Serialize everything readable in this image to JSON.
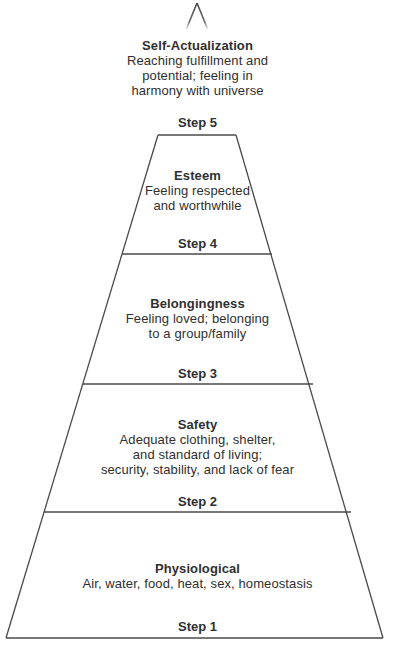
{
  "diagram": {
    "line_color": "#4a4a4a",
    "text_color": "#2f2f2f",
    "background": "#ffffff",
    "apex_marker": "pyramid-apex-lines"
  },
  "levels": [
    {
      "id": "self-actualization",
      "title": "Self-Actualization",
      "description": "Reaching fulfillment and\npotential; feeling in\nharmony with universe",
      "step_label": "Step 5"
    },
    {
      "id": "esteem",
      "title": "Esteem",
      "description": "Feeling respected\nand worthwhile",
      "step_label": "Step 4"
    },
    {
      "id": "belongingness",
      "title": "Belongingness",
      "description": "Feeling loved; belonging\nto a group/family",
      "step_label": "Step 3"
    },
    {
      "id": "safety",
      "title": "Safety",
      "description": "Adequate clothing, shelter,\nand standard of living;\nsecurity, stability, and lack of fear",
      "step_label": "Step 2"
    },
    {
      "id": "physiological",
      "title": "Physiological",
      "description": "Air, water, food, heat, sex, homeostasis",
      "step_label": "Step 1"
    }
  ]
}
